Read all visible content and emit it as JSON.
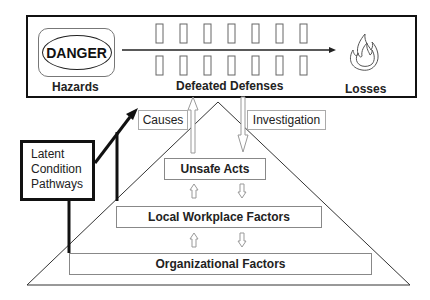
{
  "top_panel": {
    "hazards_label": "Hazards",
    "danger_sign_text": "DANGER",
    "defenses_label": "Defeated Defenses",
    "losses_label": "Losses",
    "barrier_count_per_row": 7,
    "icons": [
      "danger-sign-icon",
      "barrier-icon",
      "arrow-right-icon",
      "flame-icon"
    ]
  },
  "flow_labels": {
    "causes": "Causes",
    "investigation": "Investigation"
  },
  "latent_box": {
    "lines": [
      "Latent",
      "Condition",
      "Pathways"
    ]
  },
  "pyramid": {
    "levels": [
      {
        "label": "Unsafe Acts"
      },
      {
        "label": "Local Workplace Factors"
      },
      {
        "label": "Organizational Factors"
      }
    ]
  },
  "colors": {
    "stroke_dark": "#111111",
    "stroke_light": "#888888",
    "background": "#ffffff"
  }
}
